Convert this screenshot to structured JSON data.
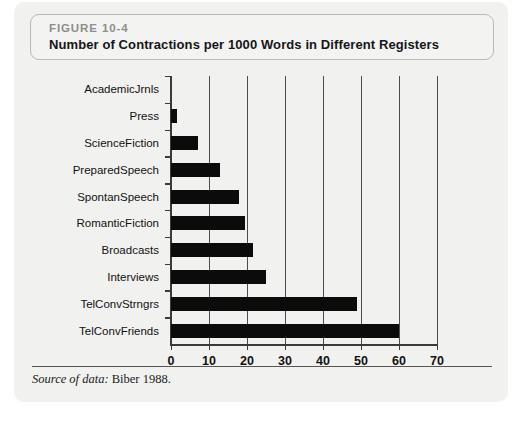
{
  "figure": {
    "number_label": "FIGURE 10-4",
    "title": "Number of Contractions per 1000 Words in Different Registers",
    "source_label": "Source of data:",
    "source_value": "Biber 1988."
  },
  "colors": {
    "bar": "#0b0b0b",
    "axis": "#3a3a3a",
    "gridline": "#4c4c4c",
    "panel_bg": "#f1f1ef",
    "caption_border": "#b9b9b6",
    "figure_number_text": "#8e8e8b"
  },
  "chart_data": {
    "type": "bar",
    "orientation": "horizontal",
    "title": "Number of Contractions per 1000 Words in Different Registers",
    "xlabel": "",
    "ylabel": "",
    "xlim": [
      0,
      70
    ],
    "xticks": [
      0,
      10,
      20,
      30,
      40,
      50,
      60,
      70
    ],
    "grid": "vertical",
    "legend": "none",
    "categories": [
      "AcademicJrnls",
      "Press",
      "ScienceFiction",
      "PreparedSpeech",
      "SpontanSpeech",
      "RomanticFiction",
      "Broadcasts",
      "Interviews",
      "TelConvStrngrs",
      "TelConvFriends"
    ],
    "values": [
      0,
      1.5,
      7,
      13,
      18,
      19.5,
      21.5,
      25,
      49,
      60
    ]
  }
}
